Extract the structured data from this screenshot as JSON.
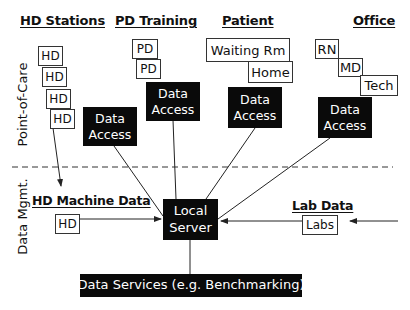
{
  "headers": {
    "hd_stations": "HD Stations",
    "pd_training": "PD Training",
    "patient": "Patient",
    "office": "Office"
  },
  "section_labels": {
    "point_of_care": "Point-of-Care",
    "data_mgmt": "Data Mgmt."
  },
  "hd_stations": {
    "boxes": [
      "HD",
      "HD",
      "HD",
      "HD"
    ],
    "data_access": "Data Access"
  },
  "pd_training": {
    "boxes": [
      "PD",
      "PD"
    ],
    "data_access": "Data Access"
  },
  "patient": {
    "boxes": [
      "Waiting Rm",
      "Home"
    ],
    "data_access": "Data Access"
  },
  "office": {
    "boxes": [
      "RN",
      "MD",
      "Tech"
    ],
    "data_access": "Data Access"
  },
  "data_mgmt": {
    "hd_machine_data": {
      "title": "HD Machine Data",
      "box": "HD"
    },
    "lab_data": {
      "title": "Lab Data",
      "box": "Labs"
    },
    "local_server": "Local Server",
    "data_services": "Data Services (e.g. Benchmarking)"
  },
  "colors": {
    "dark_box": "#0a0a0a",
    "line": "#222222",
    "background": "#ffffff"
  }
}
